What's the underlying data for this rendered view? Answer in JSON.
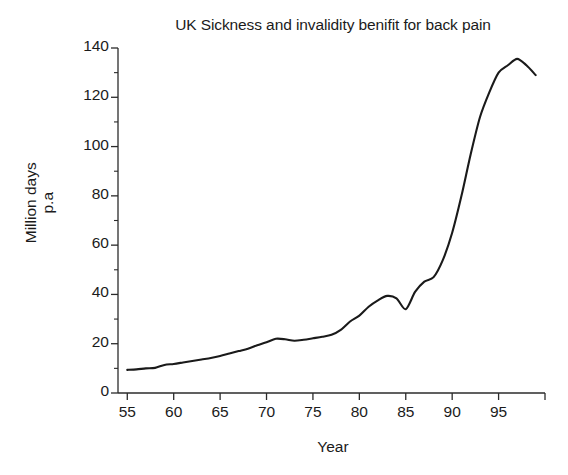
{
  "chart_data": {
    "type": "line",
    "title": "UK Sickness and invalidity benifit for back pain",
    "xlabel": "Year",
    "ylabel_line1": "Million days",
    "ylabel_line2": "p.a",
    "ylabel": "Million days p.a",
    "xlim": [
      54,
      100
    ],
    "ylim": [
      0,
      140
    ],
    "grid": false,
    "legend": "none",
    "y_major_ticks": [
      0,
      20,
      40,
      60,
      80,
      100,
      120,
      140
    ],
    "y_minor_ticks": [
      10,
      30,
      50,
      70,
      90,
      110,
      130
    ],
    "x_major_ticks": [
      55,
      60,
      65,
      70,
      75,
      80,
      85,
      90,
      95
    ],
    "x_tick_labels": [
      "55",
      "60",
      "65",
      "70",
      "75",
      "80",
      "85",
      "90",
      "95"
    ],
    "y_tick_labels": [
      "0",
      "20",
      "40",
      "60",
      "80",
      "100",
      "120",
      "140"
    ],
    "line_color": "#1a1a1a",
    "line_width": 2.1,
    "series": [
      {
        "name": "Million days p.a",
        "x": [
          55,
          56,
          57,
          58,
          59,
          60,
          61,
          62,
          63,
          64,
          65,
          66,
          67,
          68,
          69,
          70,
          71,
          72,
          73,
          74,
          75,
          76,
          77,
          78,
          79,
          80,
          81,
          82,
          83,
          84,
          85,
          86,
          87,
          88,
          89,
          90,
          91,
          92,
          93,
          94,
          95,
          96,
          97,
          98,
          99
        ],
        "values": [
          9.4,
          9.6,
          10.0,
          10.2,
          11.4,
          11.8,
          12.4,
          13.0,
          13.6,
          14.2,
          15.0,
          16.0,
          17.0,
          18.0,
          19.4,
          20.6,
          22.0,
          21.8,
          21.2,
          21.6,
          22.2,
          22.8,
          23.6,
          25.6,
          29.0,
          31.4,
          35.0,
          37.6,
          39.4,
          38.4,
          34.0,
          41.0,
          45.2,
          47.0,
          54.0,
          65.0,
          80.0,
          97.0,
          112.0,
          122.0,
          130.0,
          133.0,
          135.6,
          133.0,
          129.0
        ]
      }
    ]
  }
}
